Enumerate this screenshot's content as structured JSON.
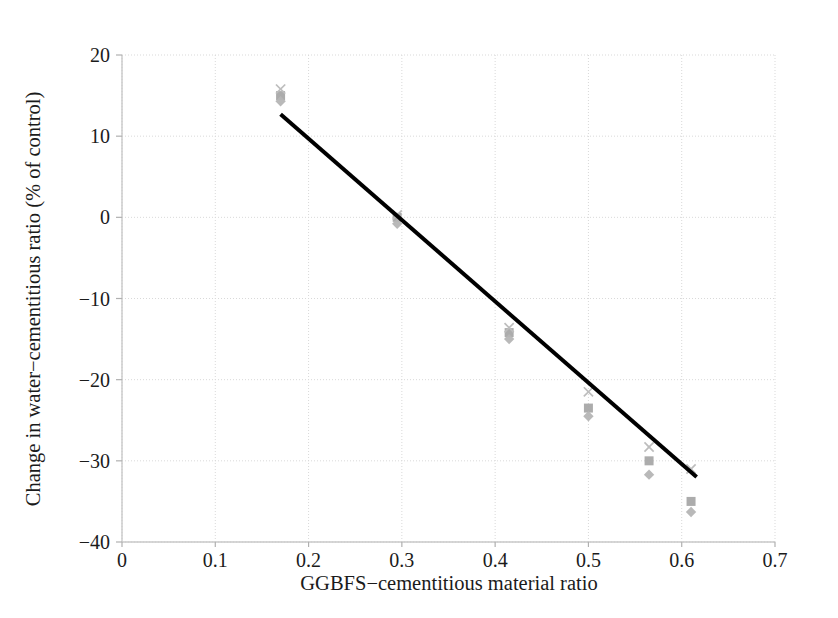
{
  "chart_data": {
    "type": "scatter",
    "title": "",
    "xlabel": "GGBFS−cementitious material ratio",
    "ylabel": "Change in water−cementitious ratio (% of control)",
    "xlim": [
      0,
      0.7
    ],
    "ylim": [
      -40,
      20
    ],
    "xticks": [
      "0",
      "0.1",
      "0.2",
      "0.3",
      "0.4",
      "0.5",
      "0.6",
      "0.7"
    ],
    "xtick_values": [
      0,
      0.1,
      0.2,
      0.3,
      0.4,
      0.5,
      0.6,
      0.7
    ],
    "yticks": [
      "20",
      "10",
      "0",
      "−10",
      "−20",
      "−30",
      "−40"
    ],
    "ytick_values": [
      20,
      10,
      0,
      -10,
      -20,
      -30,
      -40
    ],
    "grid": true,
    "grid_color": "#d9d9d9",
    "legend": "none",
    "marker_color": "#b3b3b3",
    "trendline_color": "#000000",
    "series": [
      {
        "name": "series-square",
        "marker": "square",
        "color": "#a8a8a8",
        "points": [
          {
            "x": 0.17,
            "y": 15.0
          },
          {
            "x": 0.295,
            "y": 0.0
          },
          {
            "x": 0.415,
            "y": -14.2
          },
          {
            "x": 0.5,
            "y": -23.5
          },
          {
            "x": 0.565,
            "y": -30.0
          },
          {
            "x": 0.61,
            "y": -35.0
          }
        ]
      },
      {
        "name": "series-diamond",
        "marker": "diamond",
        "color": "#b5b5b5",
        "points": [
          {
            "x": 0.17,
            "y": 14.3
          },
          {
            "x": 0.295,
            "y": -0.8
          },
          {
            "x": 0.415,
            "y": -15.0
          },
          {
            "x": 0.5,
            "y": -24.5
          },
          {
            "x": 0.565,
            "y": -31.7
          },
          {
            "x": 0.61,
            "y": -36.3
          }
        ]
      },
      {
        "name": "series-cross",
        "marker": "x",
        "color": "#bdbdbd",
        "points": [
          {
            "x": 0.17,
            "y": 15.8
          },
          {
            "x": 0.295,
            "y": 0.3
          },
          {
            "x": 0.415,
            "y": -13.6
          },
          {
            "x": 0.5,
            "y": -21.5
          },
          {
            "x": 0.565,
            "y": -28.3
          },
          {
            "x": 0.61,
            "y": -31.0
          }
        ]
      }
    ],
    "trendline": {
      "name": "linear-fit",
      "x0": 0.17,
      "y0": 12.7,
      "x1": 0.616,
      "y1": -32.0,
      "width": 4
    }
  }
}
